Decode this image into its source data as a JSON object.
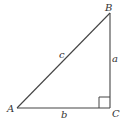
{
  "diagram": {
    "type": "right-triangle",
    "vertices": {
      "A": {
        "label": "A",
        "x": 17,
        "y": 108
      },
      "B": {
        "label": "B",
        "x": 110,
        "y": 13
      },
      "C": {
        "label": "C",
        "x": 110,
        "y": 108
      }
    },
    "sides": {
      "a": {
        "label": "a",
        "between": [
          "B",
          "C"
        ]
      },
      "b": {
        "label": "b",
        "between": [
          "A",
          "C"
        ]
      },
      "c": {
        "label": "c",
        "between": [
          "A",
          "B"
        ]
      }
    },
    "right_angle_at": "C",
    "colors": {
      "stroke": "#444444",
      "text": "#333333",
      "background": "#ffffff"
    }
  }
}
